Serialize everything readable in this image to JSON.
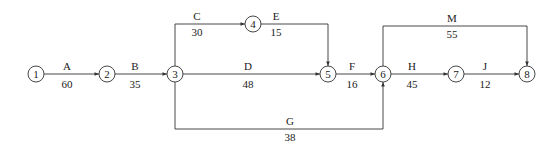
{
  "diagram": {
    "type": "activity-on-arrow network",
    "nodes": [
      {
        "id": "1",
        "label": "1",
        "x": 36,
        "y": 74
      },
      {
        "id": "2",
        "label": "2",
        "x": 107,
        "y": 74
      },
      {
        "id": "3",
        "label": "3",
        "x": 175,
        "y": 74
      },
      {
        "id": "4",
        "label": "4",
        "x": 253,
        "y": 24
      },
      {
        "id": "5",
        "label": "5",
        "x": 328,
        "y": 74
      },
      {
        "id": "6",
        "label": "6",
        "x": 383,
        "y": 74
      },
      {
        "id": "7",
        "label": "7",
        "x": 456,
        "y": 74
      },
      {
        "id": "8",
        "label": "8",
        "x": 527,
        "y": 74
      }
    ],
    "activities": [
      {
        "name": "A",
        "duration": "60",
        "from": "1",
        "to": "2"
      },
      {
        "name": "B",
        "duration": "35",
        "from": "2",
        "to": "3"
      },
      {
        "name": "C",
        "duration": "30",
        "from": "3",
        "to": "4"
      },
      {
        "name": "E",
        "duration": "15",
        "from": "4",
        "to": "5"
      },
      {
        "name": "D",
        "duration": "48",
        "from": "3",
        "to": "5"
      },
      {
        "name": "F",
        "duration": "16",
        "from": "5",
        "to": "6"
      },
      {
        "name": "G",
        "duration": "38",
        "from": "3",
        "to": "6"
      },
      {
        "name": "M",
        "duration": "55",
        "from": "6",
        "to": "8"
      },
      {
        "name": "H",
        "duration": "45",
        "from": "6",
        "to": "7"
      },
      {
        "name": "J",
        "duration": "12",
        "from": "7",
        "to": "8"
      }
    ]
  }
}
